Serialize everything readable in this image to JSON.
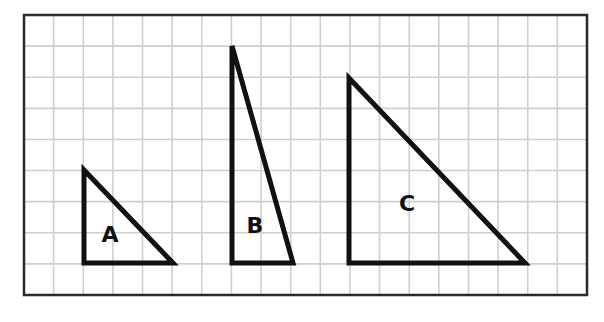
{
  "diagram": {
    "frame": {
      "x": 24,
      "y": 15,
      "width": 563,
      "height": 280
    },
    "grid": {
      "columns": 19,
      "rows": 9,
      "line_color": "#cfcfcf"
    },
    "triangles": [
      {
        "label": "A",
        "points": "84,170 84,263 173,263",
        "label_x": 110,
        "label_y": 242
      },
      {
        "label": "B",
        "points": "232,46 232,263 293,263",
        "label_x": 255,
        "label_y": 233
      },
      {
        "label": "C",
        "points": "349,78 349,263 525,263",
        "label_x": 407,
        "label_y": 211
      }
    ]
  }
}
